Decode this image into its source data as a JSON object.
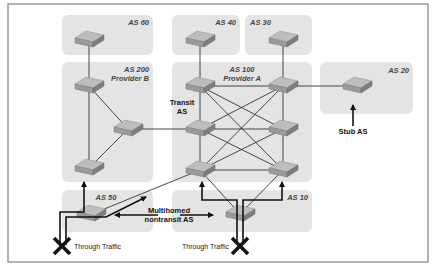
{
  "diagram": {
    "autonomous_systems": [
      {
        "id": "as60",
        "label": "AS 60",
        "sublabel": ""
      },
      {
        "id": "as200",
        "label": "AS 200",
        "sublabel": "Provider B"
      },
      {
        "id": "as40",
        "label": "AS 40",
        "sublabel": ""
      },
      {
        "id": "as30",
        "label": "AS 30",
        "sublabel": ""
      },
      {
        "id": "as100",
        "label": "AS 100",
        "sublabel": "Provider A"
      },
      {
        "id": "as20",
        "label": "AS 20",
        "sublabel": ""
      },
      {
        "id": "as50",
        "label": "AS 50",
        "sublabel": ""
      },
      {
        "id": "as10",
        "label": "AS 10",
        "sublabel": ""
      }
    ],
    "annotations": {
      "transit_line1": "Transit",
      "transit_line2": "AS",
      "stub": "Stub AS",
      "multihomed_line1": "Multihomed",
      "multihomed_line2": "nontransit AS",
      "through_traffic_left": "Through Traffic",
      "through_traffic_right": "Through Traffic"
    },
    "colors": {
      "as_fill": "#e4e4e4",
      "router_top": "#b9b9b9",
      "router_side": "#8a8a8a",
      "link": "#333333",
      "blocked_x": "#111111"
    },
    "icons": {
      "router": "router-icon",
      "blocked": "x-mark-icon",
      "arrow": "arrow-icon"
    }
  }
}
